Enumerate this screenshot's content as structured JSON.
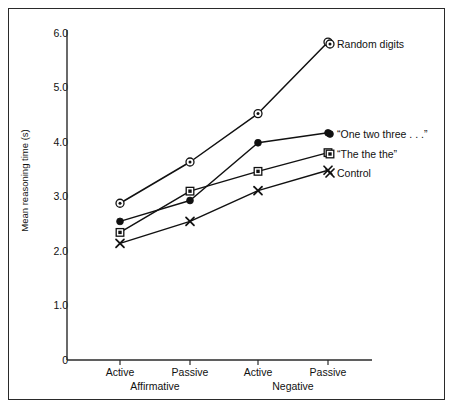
{
  "chart_data": {
    "type": "line",
    "title": "",
    "subtitle": "",
    "xlabel": "",
    "ylabel": "Mean reasoning time (s)",
    "ylim": [
      0,
      6.0
    ],
    "yticks": [
      "0",
      "1.0",
      "2.0",
      "3.0",
      "4.0",
      "5.0",
      "6.0"
    ],
    "ytick_values": [
      0,
      1.0,
      2.0,
      3.0,
      4.0,
      5.0,
      6.0
    ],
    "grid": false,
    "legend_position": "right-inline-at-line-end",
    "categories": [
      "Active",
      "Passive",
      "Active",
      "Passive"
    ],
    "x_group_labels": [
      "Affirmative",
      "Negative"
    ],
    "x_groups": [
      {
        "label": "Affirmative",
        "levels": [
          "Active",
          "Passive"
        ]
      },
      {
        "label": "Negative",
        "levels": [
          "Active",
          "Passive"
        ]
      }
    ],
    "series": [
      {
        "name": "Random digits",
        "marker": "circle-dot",
        "values": [
          2.85,
          3.6,
          4.48,
          5.78
        ]
      },
      {
        "name": "“One two three . . .”",
        "marker": "filled-circle",
        "values": [
          2.52,
          2.9,
          3.95,
          4.13
        ]
      },
      {
        "name": "“The the the”",
        "marker": "square-dot",
        "values": [
          2.32,
          3.07,
          3.43,
          3.77
        ]
      },
      {
        "name": "Control",
        "marker": "x-cross",
        "values": [
          2.12,
          2.52,
          3.08,
          3.45
        ]
      }
    ],
    "colors": {
      "line": "#111111",
      "marker": "#111111",
      "axis": "#2a2a2a",
      "text": "#111111",
      "background": "#ffffff",
      "frame": "#2a2a2a"
    }
  },
  "axis": {
    "y_title": "Mean reasoning time (s)",
    "y_tick_labels": [
      "6.0",
      "5.0",
      "4.0",
      "3.0",
      "2.0",
      "1.0",
      "0"
    ],
    "x_tick_labels": [
      "Active",
      "Passive",
      "Active",
      "Passive"
    ],
    "x_group_labels": [
      "Affirmative",
      "Negative"
    ]
  },
  "legend": {
    "entries": [
      {
        "label": "Random digits",
        "marker": "circle-dot"
      },
      {
        "label": "“One two three . . .”",
        "marker": "filled-circle"
      },
      {
        "label": "“The the the”",
        "marker": "square-dot"
      },
      {
        "label": "Control",
        "marker": "x-cross"
      }
    ]
  }
}
